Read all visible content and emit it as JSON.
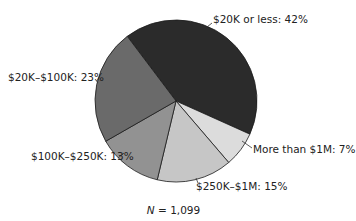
{
  "chart_data": {
    "type": "pie",
    "title": "",
    "note": "N = 1,099",
    "note_variable": "N",
    "note_value": "= 1,099",
    "start_angle_deg_clockwise_from_top": 323,
    "direction": "clockwise",
    "categories": [
      "$20K or less",
      "More than $1M",
      "$250K–$1M",
      "$100K–$250K",
      "$20K–$100K"
    ],
    "values": [
      42,
      7,
      15,
      13,
      23
    ],
    "unit": "%",
    "colors": [
      "#2b2b2b",
      "#dcdcdc",
      "#c6c6c6",
      "#929292",
      "#6a6a6a"
    ],
    "labels": [
      "$20K or less: 42%",
      "More than $1M: 7%",
      "$250K–$1M: 15%",
      "$100K–$250K: 13%",
      "$20K–$100K: 23%"
    ]
  },
  "layout": {
    "center": [
      176,
      101
    ],
    "radius": 81,
    "label_positions": [
      {
        "x": 213,
        "y": 13,
        "anchor": [
          212,
          23
        ],
        "leader_to": [
          207,
          27
        ]
      },
      {
        "x": 253,
        "y": 146,
        "anchor": [
          252,
          148
        ],
        "leader_to": [
          242,
          141
        ]
      },
      {
        "x": 196,
        "y": 182,
        "anchor": [
          198,
          183
        ],
        "leader_to": [
          196,
          178
        ]
      },
      {
        "x": 31,
        "y": 152,
        "anchor": [
          118,
          158
        ],
        "leader_to": [
          124,
          153
        ]
      },
      {
        "x": 8,
        "y": 73,
        "anchor": [
          95,
          79
        ],
        "leader_to": [
          98,
          83
        ]
      }
    ]
  }
}
